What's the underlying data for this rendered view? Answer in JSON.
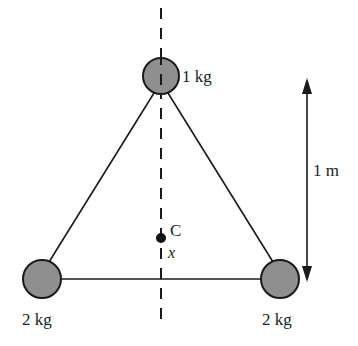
{
  "diagram": {
    "type": "physics-center-of-mass",
    "masses": [
      {
        "id": "top",
        "label": "1 kg",
        "cx": 161,
        "cy": 76
      },
      {
        "id": "bottom-left",
        "label": "2 kg",
        "cx": 42,
        "cy": 279
      },
      {
        "id": "bottom-right",
        "label": "2 kg",
        "cx": 280,
        "cy": 279
      }
    ],
    "center_point": {
      "label": "C",
      "distance_label": "x"
    },
    "dimension": {
      "label": "1 m"
    },
    "colors": {
      "mass_fill": "#8f8f8f",
      "stroke": "#1a1a1a",
      "text": "#222222",
      "background": "#ffffff"
    }
  }
}
